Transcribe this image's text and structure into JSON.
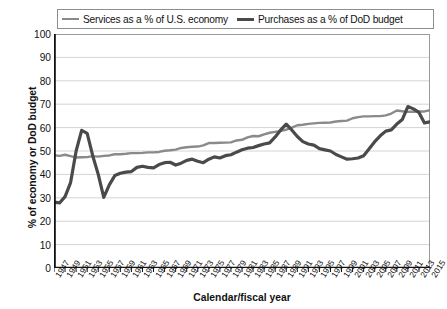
{
  "legend": {
    "position": "top",
    "entries": [
      {
        "label": "Services as a % of U.S. economy",
        "color": "#8a8a8a",
        "key": "services"
      },
      {
        "label": "Purchases as a % of DoD budget",
        "color": "#4a4a4a",
        "key": "purchases"
      }
    ]
  },
  "axes": {
    "y_title": "% of economy or DoD budget",
    "x_title": "Calendar/fiscal year",
    "y_ticks": [
      "0",
      "10",
      "20",
      "30",
      "40",
      "50",
      "60",
      "70",
      "80",
      "90",
      "100"
    ],
    "x_ticks": [
      "1947",
      "1949",
      "1951",
      "1953",
      "1955",
      "1957",
      "1959",
      "1961",
      "1963",
      "1965",
      "1967",
      "1969",
      "1971",
      "1973",
      "1975",
      "1977",
      "1979",
      "1981",
      "1983",
      "1985",
      "1987",
      "1989",
      "1991",
      "1993",
      "1995",
      "1997",
      "1999",
      "2001",
      "2003",
      "2005",
      "2007",
      "2009",
      "2011",
      "2013",
      "2015"
    ]
  },
  "chart_data": {
    "type": "line",
    "title": "",
    "subtitle": "",
    "xlabel": "Calendar/fiscal year",
    "ylabel": "% of economy or DoD budget",
    "xlim": [
      1947,
      2015
    ],
    "ylim": [
      0,
      100
    ],
    "ytick_step": 10,
    "grid": "horizontal",
    "legend_position": "top",
    "x": [
      1947,
      1948,
      1949,
      1950,
      1951,
      1952,
      1953,
      1954,
      1955,
      1956,
      1957,
      1958,
      1959,
      1960,
      1961,
      1962,
      1963,
      1964,
      1965,
      1966,
      1967,
      1968,
      1969,
      1970,
      1971,
      1972,
      1973,
      1974,
      1975,
      1976,
      1977,
      1978,
      1979,
      1980,
      1981,
      1982,
      1983,
      1984,
      1985,
      1986,
      1987,
      1988,
      1989,
      1990,
      1991,
      1992,
      1993,
      1994,
      1995,
      1996,
      1997,
      1998,
      1999,
      2000,
      2001,
      2002,
      2003,
      2004,
      2005,
      2006,
      2007,
      2008,
      2009,
      2010,
      2011,
      2012,
      2013,
      2014,
      2015
    ],
    "series": [
      {
        "name": "Services as a % of U.S. economy",
        "color": "#8a8a8a",
        "width": 2.4,
        "values": [
          48.2,
          47.9,
          48.4,
          47.8,
          47.2,
          47.3,
          47.4,
          47.8,
          47.6,
          47.9,
          48.1,
          48.6,
          48.6,
          48.8,
          49.1,
          49.1,
          49.2,
          49.4,
          49.4,
          49.6,
          50.1,
          50.3,
          50.6,
          51.3,
          51.6,
          51.8,
          51.9,
          52.4,
          53.4,
          53.4,
          53.5,
          53.6,
          53.7,
          54.5,
          54.8,
          55.8,
          56.4,
          56.3,
          57.1,
          57.8,
          58.2,
          58.6,
          59.1,
          60.0,
          61.0,
          61.2,
          61.6,
          61.8,
          62.0,
          62.1,
          62.2,
          62.6,
          62.8,
          63.0,
          64.0,
          64.5,
          64.8,
          64.8,
          64.9,
          64.9,
          65.2,
          66.0,
          67.3,
          67.0,
          66.8,
          66.8,
          66.9,
          66.9,
          67.4
        ]
      },
      {
        "name": "Purchases as a % of DoD budget",
        "color": "#4a4a4a",
        "width": 3.2,
        "values": [
          28.2,
          27.8,
          30.5,
          36.5,
          50.0,
          58.8,
          57.5,
          48.0,
          40.0,
          30.2,
          35.5,
          39.5,
          40.5,
          41.0,
          41.2,
          43.0,
          43.5,
          43.0,
          42.8,
          44.2,
          45.0,
          45.2,
          44.0,
          44.8,
          46.0,
          46.5,
          45.6,
          45.0,
          46.5,
          47.5,
          47.0,
          48.0,
          48.4,
          49.5,
          50.5,
          51.2,
          51.5,
          52.3,
          53.0,
          53.5,
          56.0,
          59.0,
          61.5,
          59.0,
          56.2,
          54.0,
          53.0,
          52.5,
          51.0,
          50.5,
          50.0,
          48.5,
          47.5,
          46.5,
          46.7,
          47.0,
          48.0,
          51.0,
          54.0,
          56.5,
          58.5,
          59.0,
          61.5,
          63.5,
          69.0,
          68.0,
          66.5,
          62.0,
          62.5
        ]
      }
    ]
  }
}
